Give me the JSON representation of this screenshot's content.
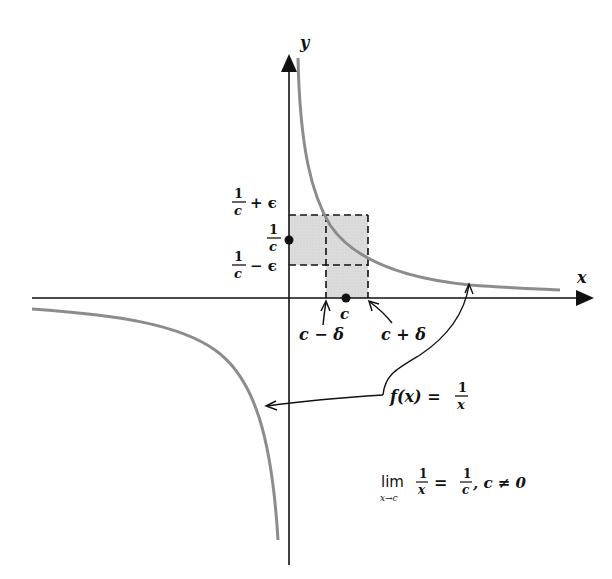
{
  "figure": {
    "type": "function graph with epsilon-delta box",
    "function_label": "f(x) = 1/x",
    "axes": {
      "x_label": "x",
      "y_label": "y"
    },
    "y_marks": {
      "upper": {
        "num": "1",
        "den": "c",
        "suffix": "+ ϵ"
      },
      "center": {
        "num": "1",
        "den": "c"
      },
      "lower": {
        "num": "1",
        "den": "c",
        "suffix": "− ϵ"
      }
    },
    "x_marks": {
      "center": "c",
      "left": "c − δ",
      "right": "c + δ"
    },
    "annotation": {
      "f_label": "f(x) =",
      "f_num": "1",
      "f_den": "x",
      "lim_word": "lim",
      "lim_sub": "x→c",
      "lim_num": "1",
      "lim_den": "x",
      "equals": "=",
      "rhs_num": "1",
      "rhs_den": "c",
      "condition": ", c ≠ 0"
    },
    "colors": {
      "curve": "#8c8c8c",
      "axes": "#111111",
      "box_fill": "#d9d9d9"
    }
  }
}
